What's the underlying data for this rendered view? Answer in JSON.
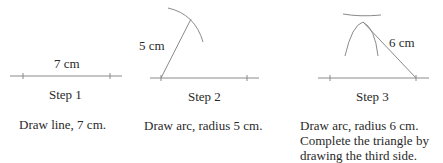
{
  "steps": [
    {
      "measure": "7 cm",
      "title": "Step 1",
      "caption": [
        "Draw line, 7 cm."
      ]
    },
    {
      "measure": "5 cm",
      "title": "Step 2",
      "caption": [
        "Draw arc, radius 5 cm."
      ]
    },
    {
      "measure": "6 cm",
      "title": "Step 3",
      "caption": [
        "Draw arc, radius 6 cm.",
        "Complete the triangle by",
        "drawing the third side."
      ]
    }
  ],
  "colors": {
    "line": "#8a8a8a",
    "text": "#2a2a2a"
  }
}
